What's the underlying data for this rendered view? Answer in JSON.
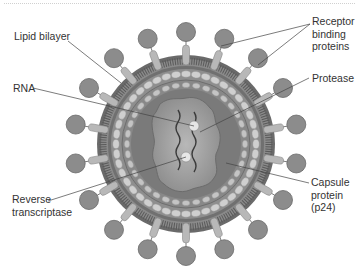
{
  "labels": {
    "lipid_bilayer": "Lipid bilayer",
    "rna": "RNA",
    "reverse_transcriptase": "Reverse\ntranscriptase",
    "receptor_binding_proteins": "Receptor\nbinding\nproteins",
    "protease": "Protease",
    "capsule_protein": "Capsule\nprotein\n(p24)"
  },
  "colors": {
    "background": "#ffffff",
    "knob": "#8c8c8c",
    "knob_stroke": "#6a6a6a",
    "stalk": "#b4b4b4",
    "membrane_outer": "#6e6e6e",
    "membrane_hatch": "#9a9a9a",
    "matrix": "#8a8a8a",
    "bead": "#c8c8c8",
    "capsid": "#7e7e7e",
    "core": "#a6a6a6",
    "text": "#333333",
    "leader": "#444444"
  }
}
